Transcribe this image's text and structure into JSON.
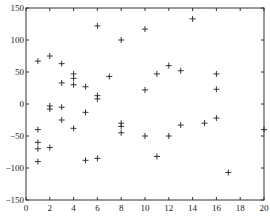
{
  "chart_data": {
    "type": "scatter",
    "title": "",
    "xlabel": "",
    "ylabel": "",
    "xlim": [
      0,
      20
    ],
    "ylim": [
      -150,
      150
    ],
    "xticks": [
      0,
      2,
      4,
      6,
      8,
      10,
      12,
      14,
      16,
      18,
      20
    ],
    "yticks": [
      -150,
      -100,
      -50,
      0,
      50,
      100,
      150
    ],
    "grid": false,
    "legend": null,
    "marker": "+",
    "marker_color": "#222222",
    "series": [
      {
        "name": "points",
        "points": [
          [
            1,
            67
          ],
          [
            1,
            -40
          ],
          [
            1,
            -60
          ],
          [
            1,
            -70
          ],
          [
            1,
            -90
          ],
          [
            2,
            75
          ],
          [
            2,
            -3
          ],
          [
            2,
            -8
          ],
          [
            2,
            -68
          ],
          [
            3,
            63
          ],
          [
            3,
            33
          ],
          [
            3,
            -5
          ],
          [
            3,
            -25
          ],
          [
            4,
            47
          ],
          [
            4,
            40
          ],
          [
            4,
            30
          ],
          [
            4,
            -38
          ],
          [
            5,
            27
          ],
          [
            5,
            -13
          ],
          [
            5,
            -88
          ],
          [
            6,
            122
          ],
          [
            6,
            13
          ],
          [
            6,
            8
          ],
          [
            6,
            -85
          ],
          [
            7,
            43
          ],
          [
            8,
            100
          ],
          [
            8,
            -30
          ],
          [
            8,
            -35
          ],
          [
            8,
            -45
          ],
          [
            10,
            117
          ],
          [
            10,
            22
          ],
          [
            10,
            -50
          ],
          [
            11,
            47
          ],
          [
            11,
            -82
          ],
          [
            12,
            60
          ],
          [
            12,
            -50
          ],
          [
            13,
            52
          ],
          [
            13,
            -33
          ],
          [
            14,
            133
          ],
          [
            15,
            -30
          ],
          [
            16,
            47
          ],
          [
            16,
            23
          ],
          [
            16,
            -22
          ],
          [
            17,
            -107
          ],
          [
            20,
            -40
          ]
        ]
      }
    ]
  }
}
